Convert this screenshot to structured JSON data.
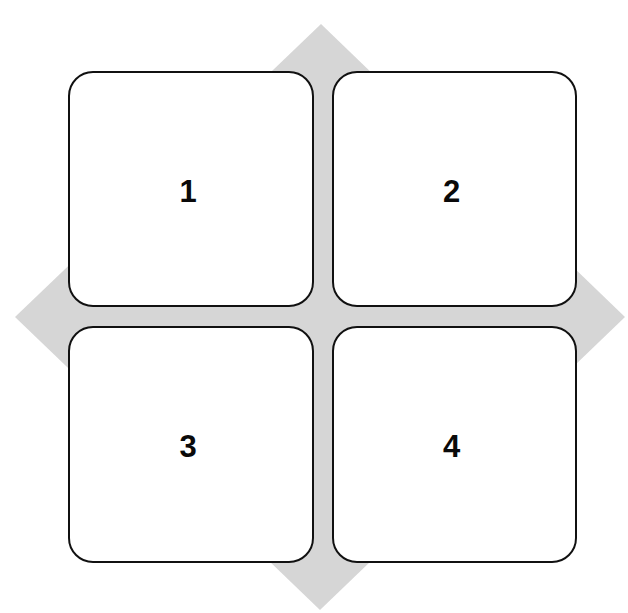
{
  "diagram": {
    "type": "quadrant-matrix",
    "background_shape": "diamond",
    "colors": {
      "diamond_fill": "#d6d6d6",
      "box_fill": "#ffffff",
      "box_border": "#111111",
      "label_color": "#0a0a0a"
    },
    "quadrants": [
      {
        "label": "1"
      },
      {
        "label": "2"
      },
      {
        "label": "3"
      },
      {
        "label": "4"
      }
    ]
  }
}
